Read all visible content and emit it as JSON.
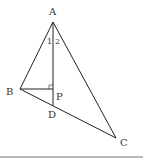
{
  "diagram": {
    "type": "geometry-triangle",
    "colors": {
      "stroke": "#222222",
      "label": "#333333",
      "rule": "#b8b8b8",
      "background": "#ffffff"
    },
    "points": {
      "A": {
        "label": "A",
        "x": 53,
        "y": 22
      },
      "B": {
        "label": "B",
        "x": 20,
        "y": 89
      },
      "C": {
        "label": "C",
        "x": 116,
        "y": 138
      },
      "P": {
        "label": "P",
        "x": 53,
        "y": 89
      },
      "D": {
        "label": "D",
        "x": 53,
        "y": 106
      }
    },
    "angle_labels": {
      "angle1": "1",
      "angle2": "2"
    },
    "segments": [
      "AB",
      "AC",
      "BC",
      "AD",
      "BP"
    ],
    "right_angle_at": "P"
  }
}
